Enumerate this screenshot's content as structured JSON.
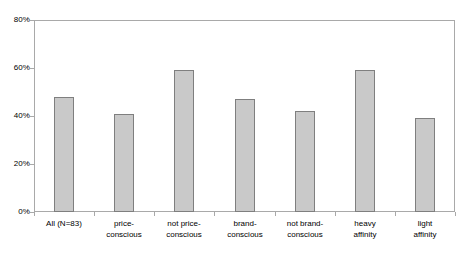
{
  "chart_data": {
    "type": "bar",
    "title": "",
    "subtitle": "",
    "xlabel": "",
    "ylabel": "",
    "ylim": [
      0,
      80
    ],
    "yticks": [
      0,
      20,
      40,
      60,
      80
    ],
    "ytick_labels": [
      "0%",
      "20%",
      "40%",
      "60%",
      "80%"
    ],
    "grid": false,
    "legend": false,
    "legend_position": "none",
    "value_suffix": "%",
    "categories": [
      "All (N=83)",
      "price-conscious",
      "not price-conscious",
      "brand-conscious",
      "not brand-conscious",
      "heavy affinity",
      "light affinity"
    ],
    "category_lines": [
      [
        "All (N=83)",
        ""
      ],
      [
        "price-",
        "conscious"
      ],
      [
        "not price-",
        "conscious"
      ],
      [
        "brand-",
        "conscious"
      ],
      [
        "not brand-",
        "conscious"
      ],
      [
        "heavy",
        "affinity"
      ],
      [
        "light",
        "affinity"
      ]
    ],
    "values": [
      48,
      41,
      59,
      47,
      42,
      59,
      39
    ],
    "bar_fill_color": "#c9c9c9",
    "bar_border_color": "#7f7f7f",
    "axis_color": "#a9a9a9",
    "background_color": "#ffffff"
  },
  "axis": {
    "y_ticks": [
      {
        "label": "80%",
        "value": 80
      },
      {
        "label": "60%",
        "value": 60
      },
      {
        "label": "40%",
        "value": 40
      },
      {
        "label": "20%",
        "value": 20
      },
      {
        "label": "0%",
        "value": 0
      }
    ]
  },
  "bars": [
    {
      "label_line1": "All (N=83)",
      "label_line2": "",
      "value": 48
    },
    {
      "label_line1": "price-",
      "label_line2": "conscious",
      "value": 41
    },
    {
      "label_line1": "not price-",
      "label_line2": "conscious",
      "value": 59
    },
    {
      "label_line1": "brand-",
      "label_line2": "conscious",
      "value": 47
    },
    {
      "label_line1": "not brand-",
      "label_line2": "conscious",
      "value": 42
    },
    {
      "label_line1": "heavy",
      "label_line2": "affinity",
      "value": 59
    },
    {
      "label_line1": "light",
      "label_line2": "affinity",
      "value": 39
    }
  ]
}
